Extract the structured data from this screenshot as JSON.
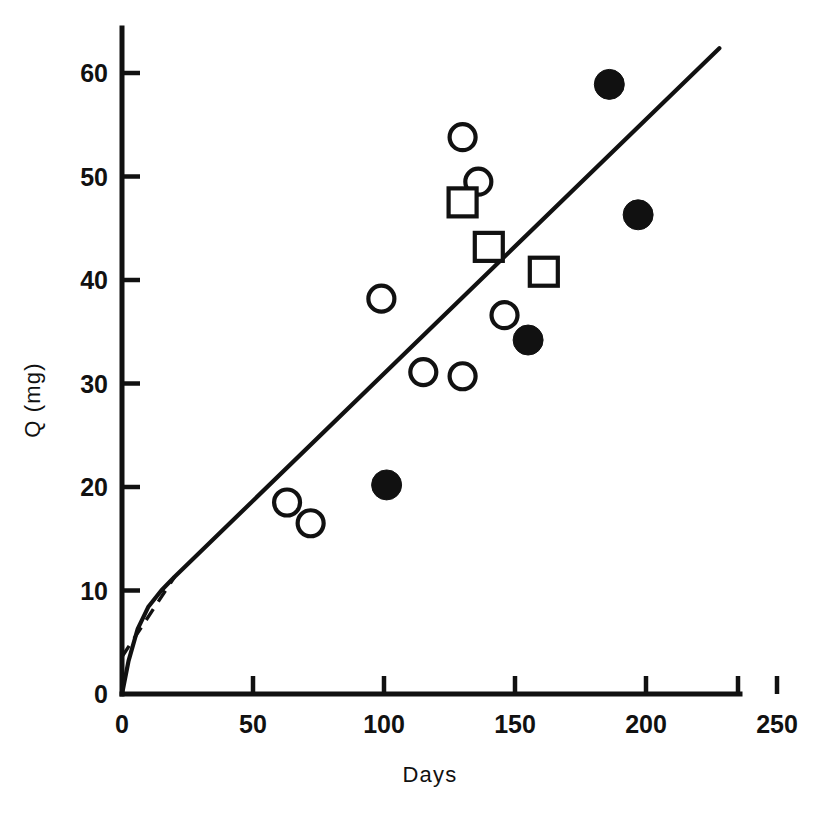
{
  "chart_data": {
    "type": "scatter",
    "title": "",
    "subtitle": "",
    "xlabel": "Days",
    "ylabel": "Q (mg)",
    "xlim": [
      0,
      250
    ],
    "ylim": [
      0,
      64
    ],
    "xticks": [
      0,
      50,
      100,
      150,
      200,
      250
    ],
    "yticks": [
      0,
      10,
      20,
      30,
      40,
      50,
      60
    ],
    "xtick_labels": [
      "0",
      "50",
      "100",
      "150",
      "200",
      "250"
    ],
    "ytick_labels": [
      "0",
      "10",
      "20",
      "30",
      "40",
      "50",
      "60"
    ],
    "grid": false,
    "legend": "none",
    "origin_label": "0",
    "series": [
      {
        "name": "open-circle",
        "marker": "open circle",
        "points": [
          {
            "x": 63,
            "y": 18.5
          },
          {
            "x": 72,
            "y": 16.5
          },
          {
            "x": 99,
            "y": 38.2
          },
          {
            "x": 115,
            "y": 31.1
          },
          {
            "x": 130,
            "y": 30.7
          },
          {
            "x": 130,
            "y": 53.8
          },
          {
            "x": 136,
            "y": 49.5
          },
          {
            "x": 146,
            "y": 36.6
          }
        ]
      },
      {
        "name": "open-square",
        "marker": "open square",
        "points": [
          {
            "x": 130,
            "y": 47.5
          },
          {
            "x": 140,
            "y": 43.2
          },
          {
            "x": 161,
            "y": 40.8
          }
        ]
      },
      {
        "name": "filled-circle",
        "marker": "filled circle",
        "points": [
          {
            "x": 101,
            "y": 20.2
          },
          {
            "x": 155,
            "y": 34.2
          },
          {
            "x": 186,
            "y": 58.9
          },
          {
            "x": 197,
            "y": 46.3
          }
        ]
      }
    ],
    "curves": [
      {
        "name": "model-fit-solid",
        "style": "solid",
        "points": [
          {
            "x": 0.0,
            "y": 0.0
          },
          {
            "x": 2.5,
            "y": 3.2
          },
          {
            "x": 6.0,
            "y": 6.3
          },
          {
            "x": 10.0,
            "y": 8.4
          },
          {
            "x": 15.0,
            "y": 10.0
          },
          {
            "x": 20.0,
            "y": 11.3
          },
          {
            "x": 228.0,
            "y": 62.4
          }
        ]
      },
      {
        "name": "initial-slope-dashed",
        "style": "dashed",
        "points": [
          {
            "x": 0.0,
            "y": 3.6
          },
          {
            "x": 20.0,
            "y": 11.3
          }
        ]
      }
    ]
  },
  "geometry": {
    "plot_origin_px": {
      "x": 122,
      "y": 694
    },
    "px_per_x_unit": 2.62,
    "px_per_y_unit": 10.35,
    "y_axis_top_px": 28,
    "x_axis_right_px": 740
  }
}
